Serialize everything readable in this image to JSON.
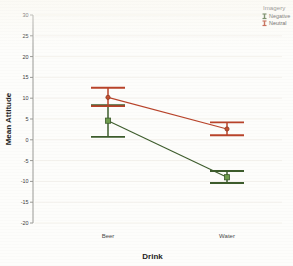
{
  "chart_data": {
    "type": "line",
    "title": "",
    "xlabel": "Drink",
    "ylabel": "Mean Attitude",
    "categories": [
      "Beer",
      "Water"
    ],
    "ylim": [
      -20,
      30
    ],
    "yticks": [
      30,
      25,
      20,
      15,
      10,
      5,
      0,
      -5,
      -10,
      -15,
      -20
    ],
    "ytick_labels": [
      "30",
      "25",
      "20",
      "15",
      "10",
      "5",
      "0",
      "-5",
      "-10",
      "-15",
      "-20"
    ],
    "grid": true,
    "legend_position": "top-right",
    "legend_title": "Imagery",
    "series": [
      {
        "name": "Negative",
        "color": "#3d5c2c",
        "marker_color": "#6f9d4e",
        "values": [
          4.6,
          -9.0
        ],
        "ci_lower": [
          0.7,
          -10.4
        ],
        "ci_upper": [
          8.3,
          -7.5
        ]
      },
      {
        "name": "Neutral",
        "color": "#b8432a",
        "marker_color": "#c4512f",
        "values": [
          10.2,
          2.6
        ],
        "ci_lower": [
          8.1,
          1.1
        ],
        "ci_upper": [
          12.5,
          4.2
        ]
      }
    ]
  },
  "legend": {
    "title": "Imagery",
    "items": [
      {
        "label": "Negative",
        "color": "#3d5c2c"
      },
      {
        "label": "Neutral",
        "color": "#b8432a"
      }
    ]
  },
  "axes": {
    "y_title": "Mean Attitude",
    "x_title": "Drink"
  }
}
